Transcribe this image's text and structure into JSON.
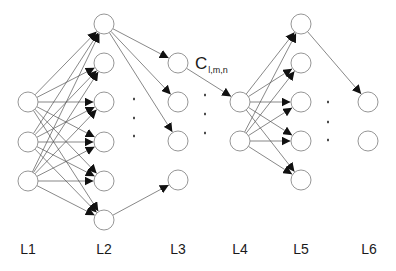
{
  "diagram": {
    "title": "",
    "node_radius": 10,
    "colors": {
      "node_stroke": "#8a8a8a",
      "edge": "#555555",
      "arrowhead": "#111111",
      "text": "#1a1a1a"
    },
    "layers": [
      {
        "id": "L1",
        "label": "L1",
        "x": 28,
        "nodes_y": [
          102,
          142,
          181
        ]
      },
      {
        "id": "L2",
        "label": "L2",
        "x": 104,
        "nodes_y": [
          24,
          63,
          102,
          142,
          181,
          220
        ]
      },
      {
        "id": "L3",
        "label": "L3",
        "x": 178,
        "nodes_y": [
          63,
          102,
          141,
          180
        ]
      },
      {
        "id": "L4",
        "label": "L4",
        "x": 240,
        "nodes_y": [
          102,
          141
        ]
      },
      {
        "id": "L5",
        "label": "L5",
        "x": 301,
        "nodes_y": [
          24,
          63,
          102,
          141,
          180
        ]
      },
      {
        "id": "L6",
        "label": "L6",
        "x": 368,
        "nodes_y": [
          102,
          141
        ]
      }
    ],
    "edges": [
      {
        "from": [
          "L1",
          "all"
        ],
        "to": [
          "L2",
          "all"
        ],
        "type": "full"
      },
      {
        "from": [
          "L2",
          0
        ],
        "to": [
          "L3",
          0
        ]
      },
      {
        "from": [
          "L2",
          0
        ],
        "to": [
          "L3",
          1
        ]
      },
      {
        "from": [
          "L2",
          0
        ],
        "to": [
          "L3",
          2
        ]
      },
      {
        "from": [
          "L2",
          5
        ],
        "to": [
          "L3",
          3
        ]
      },
      {
        "from": [
          "L3",
          0
        ],
        "to": [
          "L4",
          0
        ]
      },
      {
        "from": [
          "L4",
          "all"
        ],
        "to": [
          "L5",
          "all"
        ],
        "type": "full"
      },
      {
        "from": [
          "L5",
          0
        ],
        "to": [
          "L6",
          0
        ]
      }
    ],
    "ellipsis_dots": [
      {
        "between": "L2-L3",
        "x": 134,
        "y": [
          99,
          118,
          136
        ]
      },
      {
        "between": "L3-L4",
        "x": 205,
        "y": [
          95,
          114,
          133
        ]
      },
      {
        "between": "L5-L6",
        "x": 328,
        "y": [
          102,
          122,
          140
        ]
      }
    ],
    "connection_label": {
      "base": "C",
      "subscript": "l,m,n",
      "edge": "L3[0] -> L4[0]"
    }
  }
}
